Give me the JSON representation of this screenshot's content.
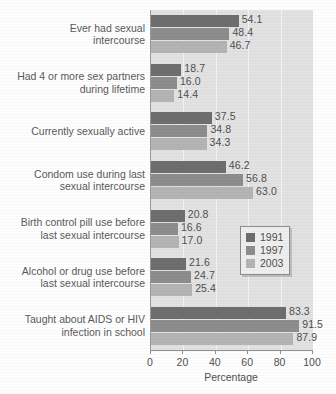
{
  "chart_data": {
    "type": "bar",
    "orientation": "horizontal",
    "title": "",
    "xlabel": "Percentage",
    "ylabel": "",
    "xlim": [
      0,
      100
    ],
    "xticks": [
      0,
      20,
      40,
      60,
      80,
      100
    ],
    "grid": true,
    "legend_position": "center-right",
    "categories": [
      "Ever had sexual\nintercourse",
      "Had 4 or more sex partners\nduring lifetime",
      "Currently sexually active",
      "Condom use during last\nsexual intercourse",
      "Birth control pill use before\nlast sexual intercourse",
      "Alcohol or drug use before\nlast sexual intercourse",
      "Taught about AIDS or HIV\ninfection in school"
    ],
    "series": [
      {
        "name": "1991",
        "color": "#6e6e6e",
        "values": [
          54.1,
          18.7,
          37.5,
          46.2,
          20.8,
          21.6,
          83.3
        ],
        "labels": [
          "54.1",
          "18.7",
          "37.5",
          "46.2",
          "20.8",
          "21.6",
          "83.3"
        ]
      },
      {
        "name": "1997",
        "color": "#8d8d8d",
        "values": [
          48.4,
          16.0,
          34.8,
          56.8,
          16.6,
          24.7,
          91.5
        ],
        "labels": [
          "48.4",
          "16.0",
          "34.8",
          "56.8",
          "16.6",
          "24.7",
          "91.5"
        ]
      },
      {
        "name": "2003",
        "color": "#b4b4b4",
        "values": [
          46.7,
          14.4,
          34.3,
          63.0,
          17.0,
          25.4,
          87.9
        ],
        "labels": [
          "46.7",
          "14.4",
          "34.3",
          "63.0",
          "17.0",
          "25.4",
          "87.9"
        ]
      }
    ]
  },
  "axis": {
    "title": "Percentage",
    "tick_labels": [
      "0",
      "20",
      "40",
      "60",
      "80",
      "100"
    ]
  },
  "legend": {
    "items": [
      {
        "label": "1991",
        "color": "#6e6e6e"
      },
      {
        "label": "1997",
        "color": "#8d8d8d"
      },
      {
        "label": "2003",
        "color": "#b4b4b4"
      }
    ]
  }
}
